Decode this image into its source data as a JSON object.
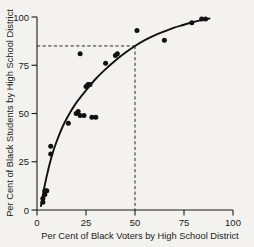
{
  "figure": {
    "background": "#f4f2ee",
    "ink": "#111111"
  },
  "chart_data": {
    "type": "scatter",
    "title": "",
    "xlabel": "Per Cent of Black Voters by High School District",
    "ylabel": "Per Cent of Black Students by High School District",
    "xlim": [
      0,
      100
    ],
    "ylim": [
      0,
      100
    ],
    "xticks": [
      0,
      25,
      50,
      75,
      100
    ],
    "yticks": [
      0,
      25,
      50,
      75,
      100
    ],
    "xticklabels": [
      "0",
      "25",
      "50",
      "75",
      "100"
    ],
    "yticklabels": [
      "0",
      "25",
      "50",
      "75",
      "100"
    ],
    "grid": false,
    "legend": null,
    "x": [
      3,
      3,
      4,
      4,
      5,
      7,
      7,
      16,
      20,
      21,
      22,
      22,
      24,
      25,
      26,
      27,
      28,
      30,
      35,
      40,
      41,
      51,
      65,
      79,
      84,
      86
    ],
    "y": [
      4,
      6,
      8,
      10,
      10,
      29,
      33,
      45,
      50,
      51,
      49,
      81,
      49,
      64,
      65,
      65,
      48,
      48,
      76,
      80,
      81,
      93,
      88,
      97,
      99,
      99
    ],
    "series": [
      {
        "name": "High school districts",
        "marker": "filled-circle",
        "values": [
          {
            "x": 3,
            "y": 4
          },
          {
            "x": 3,
            "y": 6
          },
          {
            "x": 4,
            "y": 8
          },
          {
            "x": 4,
            "y": 10
          },
          {
            "x": 5,
            "y": 10
          },
          {
            "x": 7,
            "y": 29
          },
          {
            "x": 7,
            "y": 33
          },
          {
            "x": 16,
            "y": 45
          },
          {
            "x": 20,
            "y": 50
          },
          {
            "x": 21,
            "y": 51
          },
          {
            "x": 22,
            "y": 49
          },
          {
            "x": 22,
            "y": 81
          },
          {
            "x": 24,
            "y": 49
          },
          {
            "x": 25,
            "y": 64
          },
          {
            "x": 26,
            "y": 65
          },
          {
            "x": 27,
            "y": 65
          },
          {
            "x": 28,
            "y": 48
          },
          {
            "x": 30,
            "y": 48
          },
          {
            "x": 35,
            "y": 76
          },
          {
            "x": 40,
            "y": 80
          },
          {
            "x": 41,
            "y": 81
          },
          {
            "x": 51,
            "y": 93
          },
          {
            "x": 65,
            "y": 88
          },
          {
            "x": 79,
            "y": 97
          },
          {
            "x": 84,
            "y": 99
          },
          {
            "x": 86,
            "y": 99
          }
        ]
      }
    ],
    "fitted_curve": {
      "name": "fitted saturating curve",
      "points": [
        {
          "x": 2.0,
          "y": 2.0
        },
        {
          "x": 4.0,
          "y": 13.0
        },
        {
          "x": 6.0,
          "y": 22.0
        },
        {
          "x": 8.0,
          "y": 29.5
        },
        {
          "x": 10.0,
          "y": 35.5
        },
        {
          "x": 13.0,
          "y": 43.0
        },
        {
          "x": 16.0,
          "y": 49.0
        },
        {
          "x": 20.0,
          "y": 55.5
        },
        {
          "x": 25.0,
          "y": 62.0
        },
        {
          "x": 30.0,
          "y": 68.0
        },
        {
          "x": 35.0,
          "y": 73.0
        },
        {
          "x": 40.0,
          "y": 77.5
        },
        {
          "x": 45.0,
          "y": 81.5
        },
        {
          "x": 50.0,
          "y": 85.0
        },
        {
          "x": 55.0,
          "y": 88.0
        },
        {
          "x": 60.0,
          "y": 90.5
        },
        {
          "x": 65.0,
          "y": 92.5
        },
        {
          "x": 70.0,
          "y": 94.5
        },
        {
          "x": 75.0,
          "y": 96.0
        },
        {
          "x": 80.0,
          "y": 97.5
        },
        {
          "x": 85.0,
          "y": 98.6
        },
        {
          "x": 88.0,
          "y": 99.2
        }
      ]
    },
    "annotations": [
      {
        "type": "reference-lines",
        "style": "dashed",
        "x_value": 50,
        "y_value": 85,
        "description": "dashed lines from y axis at 85 across to x = 50, then down to x axis"
      }
    ]
  },
  "caption": {
    "text": ""
  }
}
